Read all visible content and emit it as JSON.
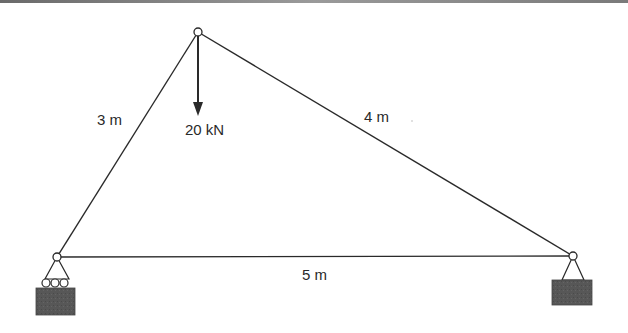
{
  "diagram": {
    "type": "truss",
    "nodes": [
      {
        "id": "top",
        "x": 198,
        "y": 32
      },
      {
        "id": "left",
        "x": 57,
        "y": 257
      },
      {
        "id": "right",
        "x": 573,
        "y": 256
      }
    ],
    "members": [
      {
        "from": "left",
        "to": "top",
        "label": "3 m"
      },
      {
        "from": "top",
        "to": "right",
        "label": "4 m"
      },
      {
        "from": "left",
        "to": "right",
        "label": "5 m"
      }
    ],
    "load": {
      "node": "top",
      "direction": "down",
      "label": "20 kN"
    },
    "supports": [
      {
        "node": "left",
        "type": "roller"
      },
      {
        "node": "right",
        "type": "pin"
      }
    ]
  },
  "labels": {
    "member_left": "3 m",
    "member_right": "4 m",
    "member_bottom": "5 m",
    "load": "20 kN"
  },
  "colors": {
    "line": "#2a2a2a",
    "support_block": "#555555"
  }
}
